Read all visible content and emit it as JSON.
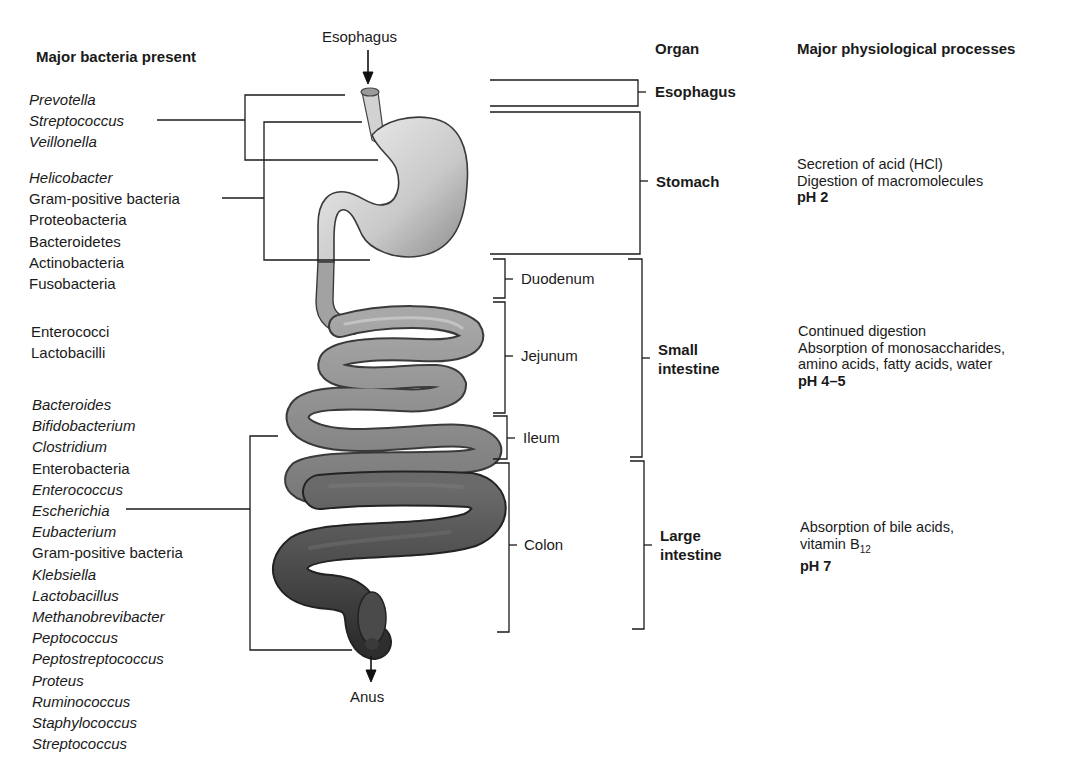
{
  "headers": {
    "bacteria": "Major bacteria present",
    "organ": "Organ",
    "processes": "Major physiological processes"
  },
  "anatomy_labels": {
    "top": "Esophagus",
    "bottom": "Anus"
  },
  "bacteria_groups": [
    {
      "region": "esophagus",
      "items": [
        {
          "name": "Prevotella",
          "italic": true
        },
        {
          "name": "Streptococcus",
          "italic": true
        },
        {
          "name": "Veillonella",
          "italic": true
        }
      ]
    },
    {
      "region": "stomach",
      "items": [
        {
          "name": "Helicobacter",
          "italic": true
        },
        {
          "name": "Gram-positive bacteria",
          "italic": false
        },
        {
          "name": "Proteobacteria",
          "italic": false
        },
        {
          "name": "Bacteroidetes",
          "italic": false
        },
        {
          "name": "Actinobacteria",
          "italic": false
        },
        {
          "name": "Fusobacteria",
          "italic": false
        }
      ]
    },
    {
      "region": "small-intestine",
      "items": [
        {
          "name": "Enterococci",
          "italic": false
        },
        {
          "name": "Lactobacilli",
          "italic": false
        }
      ]
    },
    {
      "region": "large-intestine",
      "items": [
        {
          "name": "Bacteroides",
          "italic": true
        },
        {
          "name": "Bifidobacterium",
          "italic": true
        },
        {
          "name": "Clostridium",
          "italic": true
        },
        {
          "name": "Enterobacteria",
          "italic": false
        },
        {
          "name": "Enterococcus",
          "italic": true
        },
        {
          "name": "Escherichia",
          "italic": true
        },
        {
          "name": "Eubacterium",
          "italic": true
        },
        {
          "name": "Gram-positive bacteria",
          "italic": false
        },
        {
          "name": "Klebsiella",
          "italic": true
        },
        {
          "name": "Lactobacillus",
          "italic": true
        },
        {
          "name": "Methanobrevibacter",
          "italic": true
        },
        {
          "name": "Peptococcus",
          "italic": true
        },
        {
          "name": "Peptostreptococcus",
          "italic": true
        },
        {
          "name": "Proteus",
          "italic": true
        },
        {
          "name": "Ruminococcus",
          "italic": true
        },
        {
          "name": "Staphylococcus",
          "italic": true
        },
        {
          "name": "Streptococcus",
          "italic": true
        }
      ]
    }
  ],
  "segments": {
    "duodenum": "Duodenum",
    "jejunum": "Jejunum",
    "ileum": "Ileum",
    "colon": "Colon"
  },
  "organs": {
    "esophagus": "Esophagus",
    "stomach": "Stomach",
    "small_intestine_1": "Small",
    "small_intestine_2": "intestine",
    "large_intestine_1": "Large",
    "large_intestine_2": "intestine"
  },
  "processes": {
    "stomach": {
      "line1": "Secretion of acid (HCl)",
      "line2": "Digestion of macromolecules",
      "ph": "pH 2"
    },
    "small_intestine": {
      "line1": "Continued digestion",
      "line2": "Absorption of monosaccharides,",
      "line3": "amino acids, fatty acids, water",
      "ph": "pH 4–5"
    },
    "large_intestine": {
      "line1": "Absorption of bile acids,",
      "line2_prefix": "vitamin B",
      "line2_sub": "12",
      "ph": "pH 7"
    }
  },
  "colors": {
    "line": "#1a1a1a",
    "upper_gut": "#bdbdbd",
    "small_intestine": "#8c8c8c",
    "colon": "#3e3e3e"
  }
}
